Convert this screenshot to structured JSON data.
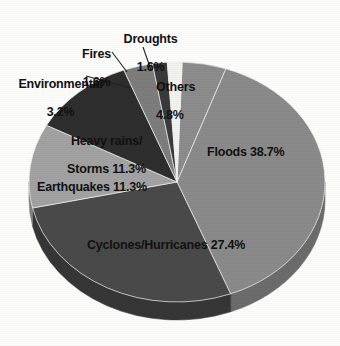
{
  "chart_data": {
    "type": "pie",
    "title": "",
    "subtitle": "",
    "xlabel": "",
    "ylabel": "",
    "legend_position": "none",
    "grid": false,
    "style": "3d-pie-exploded-none",
    "units": "percent",
    "categories": [
      "Others",
      "Floods",
      "Cyclones/Hurricanes",
      "Earthquakes",
      "Heavy rains/Storms",
      "Environmental",
      "Fires",
      "Droughts"
    ],
    "values": [
      4.8,
      38.7,
      27.4,
      11.3,
      11.3,
      3.2,
      1.6,
      1.6
    ],
    "colors": [
      "#8c8c8c",
      "#8a8a8a",
      "#4a4a4a",
      "#a2a2a2",
      "#2e2e2e",
      "#7d7d7d",
      "#3a3a3a",
      "#f2f2f0"
    ],
    "slices": [
      {
        "name": "Others",
        "value": 4.8,
        "label": "Others",
        "value_label": "4.8%",
        "label_full": "Others 4.8%",
        "color": "#8c8c8c",
        "side_color": "#6f6f6f"
      },
      {
        "name": "Floods",
        "value": 38.7,
        "label": "Floods",
        "value_label": "38.7%",
        "label_full": "Floods 38.7%",
        "color": "#8a8a8a",
        "side_color": "#6c6c6c"
      },
      {
        "name": "Cyclones/Hurricanes",
        "value": 27.4,
        "label": "Cyclones/Hurricanes",
        "value_label": "27.4%",
        "label_full": "Cyclones/Hurricanes 27.4%",
        "color": "#4a4a4a",
        "side_color": "#363636"
      },
      {
        "name": "Earthquakes",
        "value": 11.3,
        "label": "Earthquakes",
        "value_label": "11.3%",
        "label_full": "Earthquakes 11.3%",
        "color": "#a2a2a2",
        "side_color": "#808080"
      },
      {
        "name": "Heavy rains/Storms",
        "value": 11.3,
        "label": "Heavy rains/Storms",
        "value_label": "11.3%",
        "label_full": "Heavy rains/ Storms 11.3%",
        "color": "#2e2e2e",
        "side_color": "#222222"
      },
      {
        "name": "Environmental",
        "value": 3.2,
        "label": "Environmental",
        "value_label": "3.2%",
        "label_full": "Environmental 3.2%",
        "color": "#7d7d7d",
        "side_color": "#606060"
      },
      {
        "name": "Fires",
        "value": 1.6,
        "label": "Fires",
        "value_label": "1.6%",
        "label_full": "Fires 1.6%",
        "color": "#3a3a3a",
        "side_color": "#2a2a2a"
      },
      {
        "name": "Droughts",
        "value": 1.6,
        "label": "Droughts",
        "value_label": "1.6%",
        "label_full": "Droughts 1.6%",
        "color": "#f2f2f0",
        "side_color": "#cfcfcd"
      }
    ]
  },
  "labels": {
    "droughts_name": "Droughts",
    "droughts_pct": "1.6%",
    "fires_name": "Fires",
    "fires_pct": "1.6%",
    "environmental_name": "Environmental",
    "environmental_pct": "3.2%",
    "others_name": "Others",
    "others_pct": "4.8%",
    "floods": "Floods 38.7%",
    "cyclones": "Cyclones/Hurricanes 27.4%",
    "earthquakes": "Earthquakes 11.3%",
    "heavy_rains_line1": "Heavy rains/",
    "heavy_rains_line2": "Storms 11.3%"
  },
  "geometry": {
    "cx": 177,
    "cy": 182,
    "rx": 148,
    "ry": 120,
    "depth": 18,
    "start_angle_deg": -88
  },
  "colors": {
    "background": "#fdfdfc",
    "text": "#111111",
    "leader_line": "#222222"
  }
}
